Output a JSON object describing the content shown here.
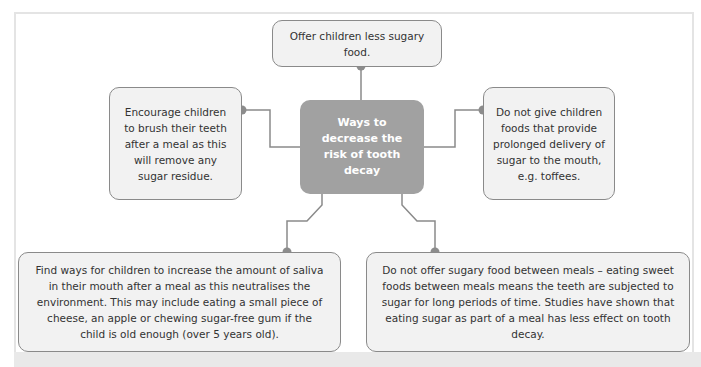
{
  "diagram": {
    "center": {
      "label": "Ways to decrease the risk of tooth decay"
    },
    "nodes": [
      {
        "id": "top",
        "text": "Offer children less sugary food."
      },
      {
        "id": "left",
        "text": "Encourage children to brush their teeth after a meal as this will remove any sugar residue."
      },
      {
        "id": "right",
        "text": "Do not give children foods that provide prolonged delivery of sugar to the mouth, e.g. toffees."
      },
      {
        "id": "bottom_left",
        "text": "Find ways for children to increase the amount of saliva in their mouth after a meal as this neutralises the environment. This may include eating a small piece of cheese, an apple or chewing sugar-free gum if the child is old enough (over 5 years old)."
      },
      {
        "id": "bottom_right",
        "text": "Do not offer sugary food between meals – eating sweet foods between meals means the teeth are subjected to sugar for long periods of time. Studies have shown that eating sugar as part of a meal has less effect on tooth decay."
      }
    ],
    "colors": {
      "center_fill": "#a1a1a1",
      "node_fill": "#f2f2f2",
      "node_border": "#8a8a8a",
      "connector": "#8a8a8a",
      "dot": "#8c8c8c"
    }
  }
}
